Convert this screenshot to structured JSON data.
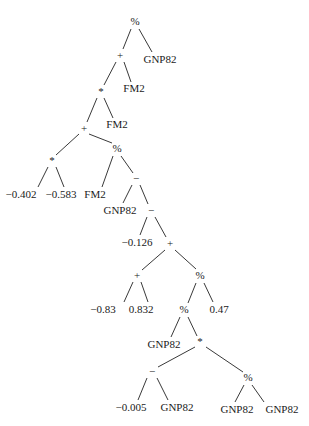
{
  "diagram": {
    "type": "expression-tree",
    "background": "#ffffff",
    "nodes": [
      {
        "id": "n0",
        "label": "%",
        "kind": "operator",
        "x": 135,
        "y": 22
      },
      {
        "id": "n1",
        "label": "+",
        "kind": "operator",
        "x": 120,
        "y": 56
      },
      {
        "id": "n2",
        "label": "GNP82",
        "kind": "variable",
        "x": 160,
        "y": 60
      },
      {
        "id": "n3",
        "label": "*",
        "kind": "operator",
        "x": 101,
        "y": 92
      },
      {
        "id": "n4",
        "label": "FM2",
        "kind": "variable",
        "x": 134,
        "y": 89
      },
      {
        "id": "n5",
        "label": "+",
        "kind": "operator",
        "x": 84,
        "y": 129
      },
      {
        "id": "n6",
        "label": "FM2",
        "kind": "variable",
        "x": 117,
        "y": 125
      },
      {
        "id": "n7",
        "label": "*",
        "kind": "operator",
        "x": 52,
        "y": 161
      },
      {
        "id": "n8",
        "label": "%",
        "kind": "operator",
        "x": 117,
        "y": 149
      },
      {
        "id": "n9",
        "label": "−0.402",
        "kind": "constant",
        "x": 21,
        "y": 195
      },
      {
        "id": "n10",
        "label": "−0.583",
        "kind": "constant",
        "x": 61,
        "y": 195
      },
      {
        "id": "n11",
        "label": "FM2",
        "kind": "variable",
        "x": 95,
        "y": 195
      },
      {
        "id": "n12",
        "label": "−",
        "kind": "operator",
        "x": 136,
        "y": 179
      },
      {
        "id": "n13",
        "label": "GNP82",
        "kind": "variable",
        "x": 120,
        "y": 211
      },
      {
        "id": "n14",
        "label": "−",
        "kind": "operator",
        "x": 151,
        "y": 211
      },
      {
        "id": "n15",
        "label": "−0.126",
        "kind": "constant",
        "x": 137,
        "y": 243
      },
      {
        "id": "n16",
        "label": "+",
        "kind": "operator",
        "x": 170,
        "y": 244
      },
      {
        "id": "n17",
        "label": "+",
        "kind": "operator",
        "x": 137,
        "y": 276
      },
      {
        "id": "n18",
        "label": "%",
        "kind": "operator",
        "x": 200,
        "y": 276
      },
      {
        "id": "n19",
        "label": "−0.83",
        "kind": "constant",
        "x": 103,
        "y": 310
      },
      {
        "id": "n20",
        "label": "0.832",
        "kind": "constant",
        "x": 141,
        "y": 310
      },
      {
        "id": "n21",
        "label": "%",
        "kind": "operator",
        "x": 184,
        "y": 310
      },
      {
        "id": "n22",
        "label": "0.47",
        "kind": "constant",
        "x": 219,
        "y": 310
      },
      {
        "id": "n23",
        "label": "GNP82",
        "kind": "variable",
        "x": 164,
        "y": 345
      },
      {
        "id": "n24",
        "label": "*",
        "kind": "operator",
        "x": 200,
        "y": 342
      },
      {
        "id": "n25",
        "label": "−",
        "kind": "operator",
        "x": 152,
        "y": 372
      },
      {
        "id": "n26",
        "label": "%",
        "kind": "operator",
        "x": 248,
        "y": 378
      },
      {
        "id": "n27",
        "label": "−0.005",
        "kind": "constant",
        "x": 131,
        "y": 408
      },
      {
        "id": "n28",
        "label": "GNP82",
        "kind": "variable",
        "x": 177,
        "y": 408
      },
      {
        "id": "n29",
        "label": "GNP82",
        "kind": "variable",
        "x": 237,
        "y": 410
      },
      {
        "id": "n30",
        "label": "GNP82",
        "kind": "variable",
        "x": 282,
        "y": 410
      }
    ],
    "edges": [
      {
        "from": "n0",
        "to": "n1",
        "x1": 131,
        "y1": 29,
        "x2": 123,
        "y2": 49
      },
      {
        "from": "n0",
        "to": "n2",
        "x1": 139,
        "y1": 29,
        "x2": 152,
        "y2": 52
      },
      {
        "from": "n1",
        "to": "n3",
        "x1": 116,
        "y1": 62,
        "x2": 104,
        "y2": 85
      },
      {
        "from": "n1",
        "to": "n4",
        "x1": 124,
        "y1": 62,
        "x2": 131,
        "y2": 82
      },
      {
        "from": "n3",
        "to": "n5",
        "x1": 97,
        "y1": 98,
        "x2": 87,
        "y2": 122
      },
      {
        "from": "n3",
        "to": "n6",
        "x1": 104,
        "y1": 98,
        "x2": 113,
        "y2": 118
      },
      {
        "from": "n5",
        "to": "n7",
        "x1": 79,
        "y1": 134,
        "x2": 56,
        "y2": 155
      },
      {
        "from": "n5",
        "to": "n8",
        "x1": 89,
        "y1": 134,
        "x2": 112,
        "y2": 143
      },
      {
        "from": "n7",
        "to": "n9",
        "x1": 48,
        "y1": 167,
        "x2": 38,
        "y2": 187
      },
      {
        "from": "n7",
        "to": "n10",
        "x1": 56,
        "y1": 167,
        "x2": 64,
        "y2": 187
      },
      {
        "from": "n8",
        "to": "n11",
        "x1": 113,
        "y1": 156,
        "x2": 102,
        "y2": 187
      },
      {
        "from": "n8",
        "to": "n12",
        "x1": 121,
        "y1": 156,
        "x2": 133,
        "y2": 173
      },
      {
        "from": "n12",
        "to": "n13",
        "x1": 132,
        "y1": 185,
        "x2": 123,
        "y2": 203
      },
      {
        "from": "n12",
        "to": "n14",
        "x1": 140,
        "y1": 185,
        "x2": 148,
        "y2": 204
      },
      {
        "from": "n14",
        "to": "n15",
        "x1": 147,
        "y1": 217,
        "x2": 140,
        "y2": 235
      },
      {
        "from": "n14",
        "to": "n16",
        "x1": 155,
        "y1": 217,
        "x2": 166,
        "y2": 237
      },
      {
        "from": "n16",
        "to": "n17",
        "x1": 165,
        "y1": 250,
        "x2": 142,
        "y2": 270
      },
      {
        "from": "n16",
        "to": "n18",
        "x1": 175,
        "y1": 250,
        "x2": 196,
        "y2": 269
      },
      {
        "from": "n17",
        "to": "n19",
        "x1": 133,
        "y1": 282,
        "x2": 124,
        "y2": 302
      },
      {
        "from": "n17",
        "to": "n20",
        "x1": 141,
        "y1": 282,
        "x2": 148,
        "y2": 302
      },
      {
        "from": "n18",
        "to": "n21",
        "x1": 196,
        "y1": 283,
        "x2": 188,
        "y2": 303
      },
      {
        "from": "n18",
        "to": "n22",
        "x1": 204,
        "y1": 283,
        "x2": 213,
        "y2": 302
      },
      {
        "from": "n21",
        "to": "n23",
        "x1": 180,
        "y1": 317,
        "x2": 171,
        "y2": 337
      },
      {
        "from": "n21",
        "to": "n24",
        "x1": 188,
        "y1": 317,
        "x2": 197,
        "y2": 336
      },
      {
        "from": "n24",
        "to": "n25",
        "x1": 195,
        "y1": 347,
        "x2": 158,
        "y2": 367
      },
      {
        "from": "n24",
        "to": "n26",
        "x1": 206,
        "y1": 347,
        "x2": 243,
        "y2": 372
      },
      {
        "from": "n25",
        "to": "n27",
        "x1": 147,
        "y1": 378,
        "x2": 138,
        "y2": 400
      },
      {
        "from": "n25",
        "to": "n28",
        "x1": 157,
        "y1": 378,
        "x2": 168,
        "y2": 400
      },
      {
        "from": "n26",
        "to": "n29",
        "x1": 244,
        "y1": 385,
        "x2": 235,
        "y2": 402
      },
      {
        "from": "n26",
        "to": "n30",
        "x1": 252,
        "y1": 385,
        "x2": 264,
        "y2": 402
      }
    ]
  }
}
